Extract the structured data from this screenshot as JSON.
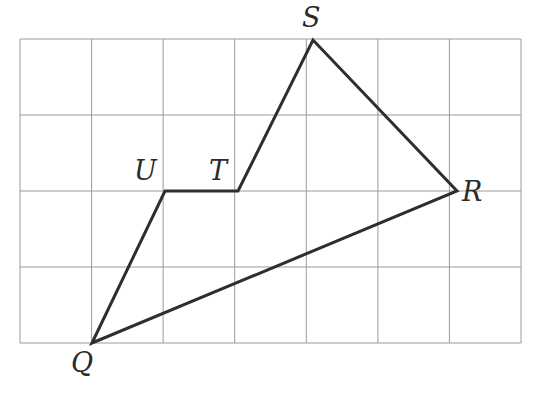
{
  "figure": {
    "background_color": "#ffffff",
    "grid": {
      "color": "#9a9a9a",
      "line_width": 1,
      "columns": 7,
      "rows": 4,
      "x_left": 20,
      "x_right": 521,
      "y_top": 39,
      "y_bottom": 343,
      "cell_width": 71.57,
      "cell_height": 76,
      "vertical_lines_x": [
        20,
        91.6,
        163.1,
        234.7,
        306.3,
        377.9,
        449.4,
        521
      ],
      "horizontal_lines_y": [
        39,
        115,
        191,
        267,
        343
      ]
    },
    "shape": {
      "stroke_color": "#2e2e2e",
      "stroke_width": 3,
      "fill": "none",
      "closed": true,
      "path_order": [
        "Q",
        "U",
        "T",
        "S",
        "R",
        "Q"
      ]
    },
    "vertices": [
      {
        "name": "Q",
        "label": "Q",
        "x": 92,
        "y": 343,
        "grid_col": 1,
        "grid_row": 4,
        "label_x": 71,
        "label_y": 349,
        "label_anchor": "below-left"
      },
      {
        "name": "U",
        "label": "U",
        "x": 165,
        "y": 191,
        "grid_col": 2,
        "grid_row": 2,
        "label_x": 134,
        "label_y": 157,
        "label_anchor": "above-left"
      },
      {
        "name": "T",
        "label": "T",
        "x": 238,
        "y": 191,
        "grid_col": 3,
        "grid_row": 2,
        "label_x": 209,
        "label_y": 157,
        "label_anchor": "above-left"
      },
      {
        "name": "S",
        "label": "S",
        "x": 313,
        "y": 40,
        "grid_col": 4,
        "grid_row": 0,
        "label_x": 302,
        "label_y": 4,
        "label_anchor": "above"
      },
      {
        "name": "R",
        "label": "R",
        "x": 457,
        "y": 191,
        "grid_col": 6,
        "grid_row": 2,
        "label_x": 462,
        "label_y": 178,
        "label_anchor": "right"
      }
    ],
    "edges": [
      {
        "name": "QU",
        "from": "Q",
        "to": "U"
      },
      {
        "name": "UT",
        "from": "U",
        "to": "T"
      },
      {
        "name": "TS",
        "from": "T",
        "to": "S"
      },
      {
        "name": "SR",
        "from": "S",
        "to": "R"
      },
      {
        "name": "RQ",
        "from": "R",
        "to": "Q"
      }
    ]
  }
}
